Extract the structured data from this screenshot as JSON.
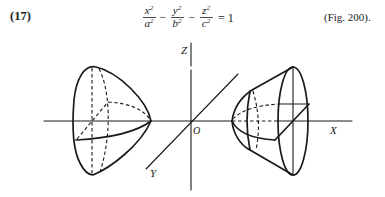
{
  "equation": {
    "number": "(17)",
    "terms": [
      {
        "num": "x",
        "num_exp": "2",
        "den": "a",
        "den_exp": "2"
      },
      {
        "num": "y",
        "num_exp": "2",
        "den": "b",
        "den_exp": "2"
      },
      {
        "num": "z",
        "num_exp": "2",
        "den": "c",
        "den_exp": "2"
      }
    ],
    "operators": [
      "−",
      "−"
    ],
    "rhs": "= 1",
    "figure_ref": "(Fig. 200)."
  },
  "figure": {
    "axis_labels": {
      "x": "X",
      "y": "Y",
      "z": "Z",
      "origin": "O"
    },
    "colors": {
      "ink": "#1a1a1a",
      "background": "#ffffff"
    }
  }
}
